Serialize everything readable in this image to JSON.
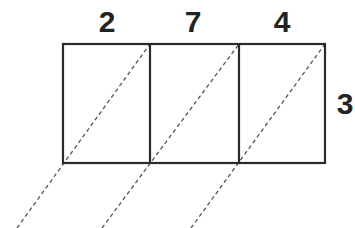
{
  "diagram": {
    "type": "lattice-multiplication-grid",
    "multiplicand_digits": [
      {
        "value": "2",
        "x": 107,
        "y": 22
      },
      {
        "value": "7",
        "x": 193,
        "y": 22
      },
      {
        "value": "4",
        "x": 282,
        "y": 22
      }
    ],
    "multiplier_digits": [
      {
        "value": "3",
        "x": 342,
        "y": 104
      }
    ],
    "grid": {
      "left": 63,
      "top": 44,
      "right": 325,
      "bottom": 163,
      "columns": [
        63,
        150,
        239,
        325
      ]
    },
    "colors": {
      "stroke": "#2a2a2a",
      "dash": "#555555",
      "text": "#222222"
    }
  }
}
